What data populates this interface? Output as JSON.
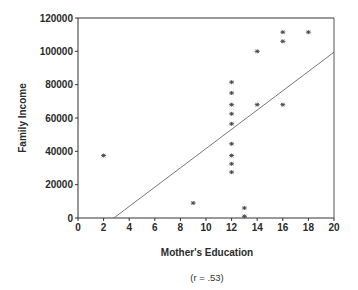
{
  "chart_data": {
    "type": "scatter",
    "title": "",
    "xlabel": "Mother's Education",
    "ylabel": "Family Income",
    "annotation": "(r = .53)",
    "xlim": [
      0,
      20
    ],
    "ylim": [
      0,
      120000
    ],
    "xticks": [
      0,
      2,
      4,
      6,
      8,
      10,
      12,
      14,
      16,
      18,
      20
    ],
    "yticks": [
      0,
      20000,
      40000,
      60000,
      80000,
      100000,
      120000
    ],
    "grid": false,
    "legend": null,
    "points": [
      {
        "x": 2,
        "y": 37500
      },
      {
        "x": 9,
        "y": 9000
      },
      {
        "x": 12,
        "y": 81500
      },
      {
        "x": 12,
        "y": 75000
      },
      {
        "x": 12,
        "y": 68000
      },
      {
        "x": 12,
        "y": 62500
      },
      {
        "x": 12,
        "y": 56500
      },
      {
        "x": 12,
        "y": 44500
      },
      {
        "x": 12,
        "y": 37500
      },
      {
        "x": 12,
        "y": 32500
      },
      {
        "x": 12,
        "y": 27500
      },
      {
        "x": 13,
        "y": 6000
      },
      {
        "x": 13,
        "y": 1000
      },
      {
        "x": 14,
        "y": 100000
      },
      {
        "x": 14,
        "y": 68000
      },
      {
        "x": 16,
        "y": 111500
      },
      {
        "x": 16,
        "y": 106000
      },
      {
        "x": 16,
        "y": 68000
      },
      {
        "x": 18,
        "y": 111500
      }
    ],
    "regression_line": {
      "x1": 2.8,
      "y1": 0,
      "x2": 20,
      "y2": 99500
    }
  }
}
